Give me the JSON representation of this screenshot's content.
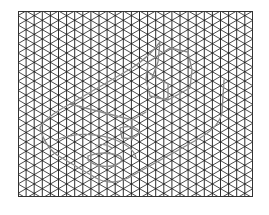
{
  "sheet": {
    "type": "isometric-grid-paper",
    "grid_line_color": "#1a1a1a",
    "sketch_color": "#8a8a8a",
    "background": "#ffffff",
    "grid_families": [
      "vertical",
      "diagonal-30-up",
      "diagonal-30-down"
    ]
  },
  "drawing": {
    "subject": "isometric sketch of a block with a hexagonal boss and a curved base",
    "parts": [
      "outer-body-outline",
      "hexagonal-boss",
      "base-curve",
      "inner-hole-curves"
    ]
  }
}
